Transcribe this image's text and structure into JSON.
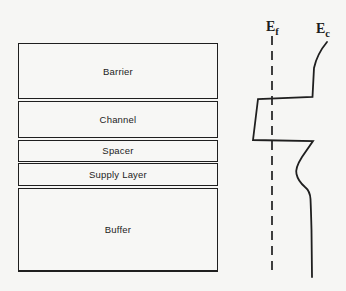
{
  "figure": {
    "layers": [
      {
        "label": "Barrier"
      },
      {
        "label": "Channel"
      },
      {
        "label": "Spacer"
      },
      {
        "label": "Supply Layer"
      },
      {
        "label": "Buffer"
      }
    ],
    "band_diagram": {
      "fermi_level": {
        "symbol": "E",
        "subscript": "f",
        "line_style": "dashed"
      },
      "conduction_band": {
        "symbol": "E",
        "subscript": "c",
        "line_style": "solid"
      },
      "fermi_line": {
        "x": 272,
        "y1": 36,
        "y2": 274
      },
      "curve_path": "M 327 42 Q 317 54 314 68 L 312.5 97 L 258 99 L 253 140 L 313 141 L 302 157 Q 295 168 296.5 174 Q 298 181 305 187 Q 310 191 310.5 199 Q 311 210 311.5 230 L 312 277"
    },
    "colors": {
      "ink": "#1f1f1f",
      "paper": "#f6f6f4"
    }
  }
}
